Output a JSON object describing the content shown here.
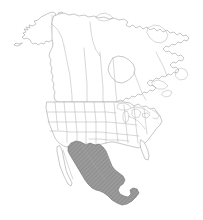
{
  "figure": {
    "kind": "distribution-map",
    "width": 203,
    "height": 220,
    "background_color": "#ffffff"
  },
  "style": {
    "land_fill": "#ffffff",
    "coastline_color": "#9a9a9a",
    "subdivision_color": "#a8a8a8",
    "range_fill": "#9b9b9b",
    "range_outline": "#6e6e6e",
    "hatch_color": "#7d7d7d"
  },
  "legend": {
    "shaded_meaning": "shaded range area",
    "unshaded_meaning": "outside range"
  },
  "regions": [
    {
      "id": "alaska",
      "name": "Alaska",
      "shaded": false
    },
    {
      "id": "canada",
      "name": "Canada",
      "shaded": false
    },
    {
      "id": "united-states",
      "name": "United States",
      "shaded": false
    },
    {
      "id": "baja",
      "name": "Baja California",
      "shaded": false
    },
    {
      "id": "mexico",
      "name": "Mexico",
      "shaded": true
    },
    {
      "id": "yucatan",
      "name": "Yucatan Peninsula",
      "shaded": true
    },
    {
      "id": "greenland-edge",
      "name": "Labrador Sea edge",
      "shaded": false
    }
  ],
  "map_data": {
    "type": "choropleth-range",
    "projection": "albers-like",
    "shaded_regions": [
      "Mexico",
      "Yucatan Peninsula"
    ],
    "unshaded_regions": [
      "Alaska",
      "Canada",
      "United States",
      "Baja California"
    ],
    "shaded_count": 2,
    "total_regions": 7
  }
}
